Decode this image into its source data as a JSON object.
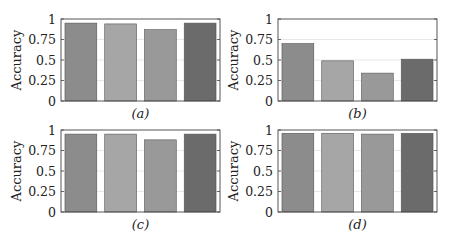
{
  "figure": {
    "panels": [
      "a",
      "b",
      "c",
      "d"
    ]
  },
  "chart_data": [
    {
      "type": "bar",
      "title": "",
      "caption": "(a)",
      "xlabel": "",
      "ylabel": "Accuracy",
      "ylim": [
        0,
        1
      ],
      "yticks": [
        "0",
        "0.25",
        "0.5",
        "0.75",
        "1"
      ],
      "grid": true,
      "categories": [
        "Bar 1",
        "Bar 2",
        "Bar 3",
        "Bar 4"
      ],
      "values": [
        0.95,
        0.94,
        0.87,
        0.95
      ],
      "colors": [
        "#8c8c8c",
        "#a6a6a6",
        "#999999",
        "#6b6b6b"
      ]
    },
    {
      "type": "bar",
      "title": "",
      "caption": "(b)",
      "xlabel": "",
      "ylabel": "Accuracy",
      "ylim": [
        0,
        1
      ],
      "yticks": [
        "0",
        "0.25",
        "0.5",
        "0.75",
        "1"
      ],
      "grid": true,
      "categories": [
        "Bar 1",
        "Bar 2",
        "Bar 3",
        "Bar 4"
      ],
      "values": [
        0.7,
        0.49,
        0.34,
        0.51
      ],
      "colors": [
        "#8c8c8c",
        "#a6a6a6",
        "#999999",
        "#6b6b6b"
      ]
    },
    {
      "type": "bar",
      "title": "",
      "caption": "(c)",
      "xlabel": "",
      "ylabel": "Accuracy",
      "ylim": [
        0,
        1
      ],
      "yticks": [
        "0",
        "0.25",
        "0.5",
        "0.75",
        "1"
      ],
      "grid": true,
      "categories": [
        "Bar 1",
        "Bar 2",
        "Bar 3",
        "Bar 4"
      ],
      "values": [
        0.95,
        0.95,
        0.88,
        0.95
      ],
      "colors": [
        "#8c8c8c",
        "#a6a6a6",
        "#999999",
        "#6b6b6b"
      ]
    },
    {
      "type": "bar",
      "title": "",
      "caption": "(d)",
      "xlabel": "",
      "ylabel": "Accuracy",
      "ylim": [
        0,
        1
      ],
      "yticks": [
        "0",
        "0.25",
        "0.5",
        "0.75",
        "1"
      ],
      "grid": true,
      "categories": [
        "Bar 1",
        "Bar 2",
        "Bar 3",
        "Bar 4"
      ],
      "values": [
        0.96,
        0.96,
        0.95,
        0.96
      ],
      "colors": [
        "#8c8c8c",
        "#a6a6a6",
        "#999999",
        "#6b6b6b"
      ]
    }
  ]
}
